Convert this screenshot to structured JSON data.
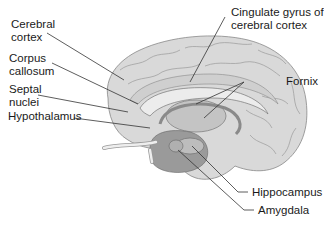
{
  "diagram": {
    "labels": {
      "cerebral_cortex": [
        "Cerebral",
        "cortex"
      ],
      "corpus_callosum": [
        "Corpus",
        "callosum"
      ],
      "septal_nuclei": [
        "Septal",
        "nuclei"
      ],
      "hypothalamus": [
        "Hypothalamus"
      ],
      "cingulate_gyrus": [
        "Cingulate gyrus of",
        "cerebral cortex"
      ],
      "fornix": [
        "Fornix"
      ],
      "hippocampus": [
        "Hippocampus"
      ],
      "amygdala": [
        "Amygdala"
      ]
    },
    "colors": {
      "cortex": "#d9d9d9",
      "cortex_shadow": "#a8a8a8",
      "corpus_callosum": "#ececec",
      "thalamus": "#c4c4c4",
      "temporal": "#9a9a9a",
      "leader_line": "#333333",
      "text": "#1a1a1a"
    }
  }
}
